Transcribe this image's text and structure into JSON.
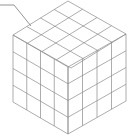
{
  "diagram": {
    "type": "isometric-cube-grid",
    "divisions": 4,
    "line_color": "#8a8a8a",
    "background": "#ffffff",
    "vertices": {
      "top": [
        68,
        1
      ],
      "left": [
        13,
        35
      ],
      "right": [
        126,
        34
      ],
      "center": [
        68,
        67
      ],
      "left_bottom": [
        13,
        102
      ],
      "right_bottom": [
        125,
        101
      ],
      "bottom": [
        68,
        134
      ]
    },
    "leader_line": {
      "points": [
        [
          0,
          5
        ],
        [
          14,
          5
        ],
        [
          31,
          26
        ]
      ]
    }
  }
}
